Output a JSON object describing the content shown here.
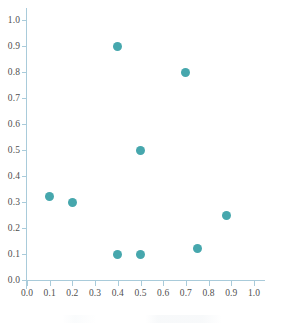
{
  "chart_data": {
    "type": "scatter",
    "title": "",
    "subtitle": "",
    "xlabel": "",
    "ylabel": "",
    "xlim": [
      0.0,
      1.0
    ],
    "ylim": [
      0.0,
      1.0
    ],
    "grid": false,
    "legend": null,
    "series": [
      {
        "name": "series-1",
        "marker": "circle",
        "color": "#46a7ad",
        "points": [
          {
            "x": 0.1,
            "y": 0.32
          },
          {
            "x": 0.2,
            "y": 0.3
          },
          {
            "x": 0.4,
            "y": 0.9
          },
          {
            "x": 0.4,
            "y": 0.1
          },
          {
            "x": 0.5,
            "y": 0.5
          },
          {
            "x": 0.5,
            "y": 0.1
          },
          {
            "x": 0.7,
            "y": 0.8
          },
          {
            "x": 0.75,
            "y": 0.12
          },
          {
            "x": 0.88,
            "y": 0.25
          }
        ]
      }
    ],
    "x_ticks": [
      {
        "value": 0.0,
        "label": "0.0"
      },
      {
        "value": 0.1,
        "label": "0.1"
      },
      {
        "value": 0.2,
        "label": "0.2"
      },
      {
        "value": 0.3,
        "label": "0.3"
      },
      {
        "value": 0.4,
        "label": "0.4"
      },
      {
        "value": 0.5,
        "label": "0.5"
      },
      {
        "value": 0.6,
        "label": "0.6"
      },
      {
        "value": 0.7,
        "label": "0.7"
      },
      {
        "value": 0.8,
        "label": "0.8"
      },
      {
        "value": 0.9,
        "label": "0.9"
      },
      {
        "value": 1.0,
        "label": "1.0"
      }
    ],
    "y_ticks": [
      {
        "value": 0.0,
        "label": "0.0"
      },
      {
        "value": 0.1,
        "label": "0.1"
      },
      {
        "value": 0.2,
        "label": "0.2"
      },
      {
        "value": 0.3,
        "label": "0.3"
      },
      {
        "value": 0.4,
        "label": "0.4"
      },
      {
        "value": 0.5,
        "label": "0.5"
      },
      {
        "value": 0.6,
        "label": "0.6"
      },
      {
        "value": 0.7,
        "label": "0.7"
      },
      {
        "value": 0.8,
        "label": "0.8"
      },
      {
        "value": 0.9,
        "label": "0.9"
      },
      {
        "value": 1.0,
        "label": "1.0"
      }
    ]
  },
  "colors": {
    "marker": "#46a7ad",
    "axis": "#a9cbda",
    "tick_label": "#4f4f4f",
    "background": "#ffffff"
  }
}
